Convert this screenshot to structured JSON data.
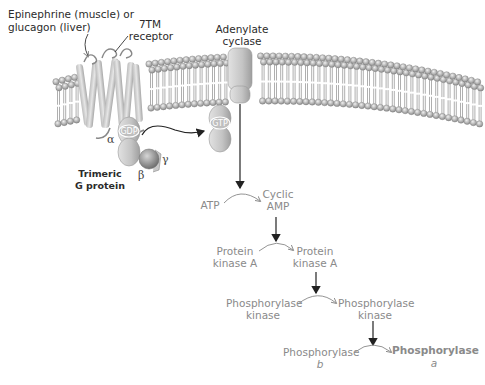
{
  "labels": {
    "ligand_line1": "Epinephrine (muscle) or",
    "ligand_line2": "glucagon (liver)",
    "receptor_line1": "7TM",
    "receptor_line2": "receptor",
    "cyclase_line1": "Adenylate",
    "cyclase_line2": "cyclase",
    "gprotein_line1": "Trimeric",
    "gprotein_line2": "G protein",
    "alpha": "α",
    "beta": "β",
    "gamma": "γ",
    "gdp": "GDP",
    "gtp": "GTP"
  },
  "cascade": {
    "step1": {
      "substrate": "ATP",
      "product_line1": "Cyclic",
      "product_line2": "AMP"
    },
    "step2": {
      "substrate_line1": "Protein",
      "substrate_line2": "kinase A",
      "product_line1": "Protein",
      "product_line2": "kinase A"
    },
    "step3": {
      "substrate_line1": "Phosphorylase",
      "substrate_line2": "kinase",
      "product_line1": "Phosphorylase",
      "product_line2": "kinase"
    },
    "step4": {
      "substrate_line1": "Phosphorylase",
      "substrate_line2": "b",
      "product_line1": "Phosphorylase",
      "product_line2": "a"
    }
  },
  "colors": {
    "lipid_head": "#b5b5b5",
    "protein": "#c8c8c8",
    "text_active": "#8a8a8a",
    "text_dark": "#2b2b2b"
  }
}
